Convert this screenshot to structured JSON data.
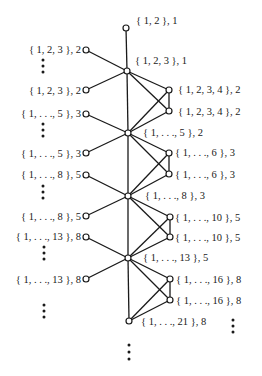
{
  "diagram": {
    "type": "graph",
    "nodes": [
      {
        "id": "n0",
        "x": 126,
        "y": 28,
        "label": "{ 1, 2 }, 1",
        "lx": 136,
        "ly": 24,
        "anchor": "start"
      },
      {
        "id": "c1",
        "x": 127,
        "y": 71,
        "label": "{ 1, 2, 3 }, 1",
        "lx": 135,
        "ly": 64,
        "anchor": "start"
      },
      {
        "id": "l1a",
        "x": 86,
        "y": 50,
        "label": "{ 1, 2, 3 }, 2",
        "lx": 81,
        "ly": 53,
        "anchor": "end"
      },
      {
        "id": "l1b",
        "x": 86,
        "y": 90,
        "label": "{ 1, 2, 3 }, 2",
        "lx": 81,
        "ly": 94,
        "anchor": "end"
      },
      {
        "id": "r1a",
        "x": 169,
        "y": 90,
        "label": "{ 1, 2, 3, 4 }, 2",
        "lx": 178,
        "ly": 93,
        "anchor": "start"
      },
      {
        "id": "r1b",
        "x": 169,
        "y": 111,
        "label": "{ 1, 2, 3, 4 }, 2",
        "lx": 178,
        "ly": 115,
        "anchor": "start"
      },
      {
        "id": "c2",
        "x": 128,
        "y": 133,
        "label": "{ 1, . . ., 5 }, 2",
        "lx": 143,
        "ly": 136,
        "anchor": "start"
      },
      {
        "id": "l2a",
        "x": 86,
        "y": 114,
        "label": "{ 1, . . ., 5 }, 3",
        "lx": 81,
        "ly": 117,
        "anchor": "end"
      },
      {
        "id": "l2b",
        "x": 86,
        "y": 153,
        "label": "{ 1, . . ., 5 }, 3",
        "lx": 81,
        "ly": 157,
        "anchor": "end"
      },
      {
        "id": "r2a",
        "x": 169,
        "y": 153,
        "label": "{ 1, . . ., 6 }, 3",
        "lx": 175,
        "ly": 156,
        "anchor": "start"
      },
      {
        "id": "r2b",
        "x": 169,
        "y": 174,
        "label": "{ 1, . . ., 6 }, 3",
        "lx": 175,
        "ly": 178,
        "anchor": "start"
      },
      {
        "id": "c3",
        "x": 128,
        "y": 196,
        "label": "{ 1, . . ., 8 }, 3",
        "lx": 145,
        "ly": 199,
        "anchor": "start"
      },
      {
        "id": "l3a",
        "x": 86,
        "y": 175,
        "label": "{ 1, . . ., 8 }, 5",
        "lx": 81,
        "ly": 178,
        "anchor": "end"
      },
      {
        "id": "l3b",
        "x": 86,
        "y": 216,
        "label": "{ 1, . . ., 8 }, 5",
        "lx": 81,
        "ly": 220,
        "anchor": "end"
      },
      {
        "id": "r3a",
        "x": 170,
        "y": 217,
        "label": "{ 1, . . ., 10 }, 5",
        "lx": 175,
        "ly": 221,
        "anchor": "start"
      },
      {
        "id": "r3b",
        "x": 170,
        "y": 237,
        "label": "{ 1, . . ., 10 }, 5",
        "lx": 175,
        "ly": 241,
        "anchor": "start"
      },
      {
        "id": "c4",
        "x": 128,
        "y": 258,
        "label": "{ 1, . . ., 13 }, 5",
        "lx": 143,
        "ly": 261,
        "anchor": "start"
      },
      {
        "id": "l4a",
        "x": 86,
        "y": 237,
        "label": "{ 1, . . ., 13 }, 8",
        "lx": 81,
        "ly": 240,
        "anchor": "end"
      },
      {
        "id": "l4b",
        "x": 86,
        "y": 279,
        "label": "{ 1, . . ., 13 }, 8",
        "lx": 81,
        "ly": 283,
        "anchor": "end"
      },
      {
        "id": "r4a",
        "x": 170,
        "y": 279,
        "label": "{ 1, . . ., 16 }, 8",
        "lx": 176,
        "ly": 283,
        "anchor": "start"
      },
      {
        "id": "r4b",
        "x": 170,
        "y": 300,
        "label": "{ 1, . . ., 16 }, 8",
        "lx": 176,
        "ly": 304,
        "anchor": "start"
      },
      {
        "id": "c5",
        "x": 129,
        "y": 321,
        "label": "{ 1, . . ., 21 }, 8",
        "lx": 141,
        "ly": 325,
        "anchor": "start"
      }
    ],
    "edges": [
      [
        "n0",
        "c1"
      ],
      [
        "c1",
        "l1a"
      ],
      [
        "c1",
        "l1b"
      ],
      [
        "c1",
        "r1a"
      ],
      [
        "c1",
        "r1b"
      ],
      [
        "c1",
        "c2"
      ],
      [
        "r1a",
        "r1b"
      ],
      [
        "c2",
        "r1a"
      ],
      [
        "c2",
        "r1b"
      ],
      [
        "c2",
        "l2a"
      ],
      [
        "c2",
        "l2b"
      ],
      [
        "c2",
        "r2a"
      ],
      [
        "c2",
        "r2b"
      ],
      [
        "c2",
        "c3"
      ],
      [
        "r2a",
        "r2b"
      ],
      [
        "c3",
        "r2a"
      ],
      [
        "c3",
        "r2b"
      ],
      [
        "c3",
        "l3a"
      ],
      [
        "c3",
        "l3b"
      ],
      [
        "c3",
        "r3a"
      ],
      [
        "c3",
        "r3b"
      ],
      [
        "c3",
        "c4"
      ],
      [
        "r3a",
        "r3b"
      ],
      [
        "c4",
        "r3a"
      ],
      [
        "c4",
        "r3b"
      ],
      [
        "c4",
        "l4a"
      ],
      [
        "c4",
        "l4b"
      ],
      [
        "c4",
        "r4a"
      ],
      [
        "c4",
        "r4b"
      ],
      [
        "c4",
        "c5"
      ],
      [
        "r4a",
        "r4b"
      ],
      [
        "c5",
        "r4a"
      ],
      [
        "c5",
        "r4b"
      ]
    ],
    "ellipses": [
      {
        "x": 43,
        "y": 60,
        "count": 3,
        "spacing": 6
      },
      {
        "x": 43,
        "y": 124,
        "count": 3,
        "spacing": 6
      },
      {
        "x": 43,
        "y": 186,
        "count": 3,
        "spacing": 6
      },
      {
        "x": 44,
        "y": 247,
        "count": 3,
        "spacing": 6
      },
      {
        "x": 44,
        "y": 305,
        "count": 3,
        "spacing": 6
      },
      {
        "x": 233,
        "y": 320,
        "count": 3,
        "spacing": 6
      },
      {
        "x": 129,
        "y": 345,
        "count": 3,
        "spacing": 7
      }
    ]
  }
}
